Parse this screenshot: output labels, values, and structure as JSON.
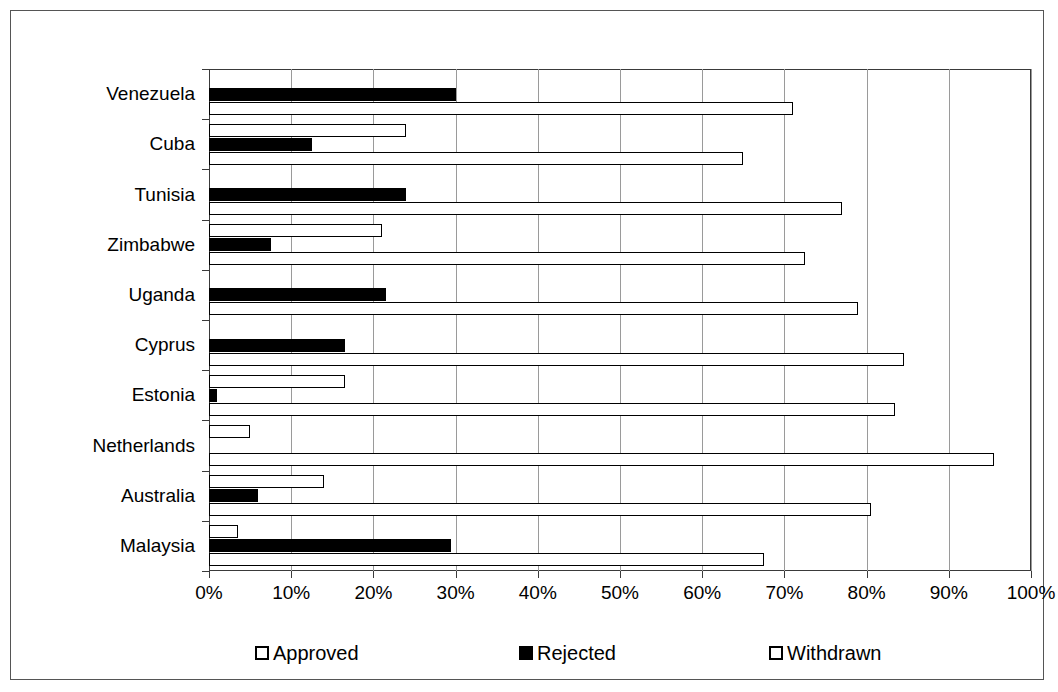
{
  "chart_data": {
    "type": "bar",
    "orientation": "horizontal",
    "title": "",
    "subtitle": "",
    "xlabel": "",
    "ylabel": "",
    "xlim": [
      0,
      100
    ],
    "xunit": "%",
    "grid": true,
    "legend_position": "bottom",
    "categories": [
      "Venezuela",
      "Cuba",
      "Tunisia",
      "Zimbabwe",
      "Uganda",
      "Cyprus",
      "Estonia",
      "Netherlands",
      "Australia",
      "Malaysia"
    ],
    "tick_labels": [
      "0%",
      "10%",
      "20%",
      "30%",
      "40%",
      "50%",
      "60%",
      "70%",
      "80%",
      "90%",
      "100%"
    ],
    "tick_values": [
      0,
      10,
      20,
      30,
      40,
      50,
      60,
      70,
      80,
      90,
      100
    ],
    "series": [
      {
        "name": "Withdrawn",
        "style": "hollow",
        "color": "#ffffff",
        "edge": "#000000",
        "values": [
          0,
          24,
          0,
          21,
          0,
          0,
          16.5,
          5,
          14,
          3.5
        ]
      },
      {
        "name": "Rejected",
        "style": "solid",
        "color": "#000000",
        "edge": "#000000",
        "values": [
          30,
          12.5,
          24,
          7.5,
          21.5,
          16.5,
          1,
          0,
          6,
          29.5
        ]
      },
      {
        "name": "Approved",
        "style": "hollow",
        "color": "#ffffff",
        "edge": "#000000",
        "values": [
          71,
          65,
          77,
          72.5,
          79,
          84.5,
          83.5,
          95.5,
          80.5,
          67.5
        ]
      }
    ],
    "legend": [
      {
        "label": "Approved",
        "style": "hollow"
      },
      {
        "label": "Rejected",
        "style": "solid"
      },
      {
        "label": "Withdrawn",
        "style": "hollow"
      }
    ]
  }
}
